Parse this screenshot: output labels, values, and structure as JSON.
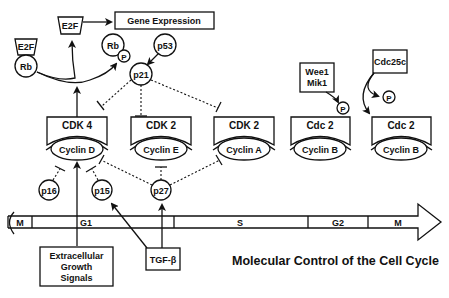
{
  "title": "Molecular Control of the Cell Cycle",
  "nodes": {
    "e2f_bound": "E2F",
    "rb_bound": "Rb",
    "e2f_free": "E2F",
    "gene_expression": "Gene Expression",
    "rb_phos": "Rb",
    "p_rb": "P",
    "p53": "p53",
    "p21": "p21",
    "p16": "p16",
    "p15": "p15",
    "p27": "p27",
    "wee1": "Wee1",
    "mik1": "Mik1",
    "p_wee": "P",
    "cdc25c": "Cdc25c",
    "p_cdc25": "P",
    "extracellular_1": "Extracellular",
    "extracellular_2": "Growth",
    "extracellular_3": "Signals",
    "tgf": "TGF-β"
  },
  "complexes": [
    {
      "kinase": "CDK 4",
      "cyclin": "Cyclin D"
    },
    {
      "kinase": "CDK 2",
      "cyclin": "Cyclin E"
    },
    {
      "kinase": "CDK 2",
      "cyclin": "Cyclin A"
    },
    {
      "kinase": "Cdc 2",
      "cyclin": "Cyclin B"
    },
    {
      "kinase": "Cdc 2",
      "cyclin": "Cyclin B"
    }
  ],
  "phases": [
    "M",
    "G1",
    "S",
    "G2",
    "M"
  ]
}
